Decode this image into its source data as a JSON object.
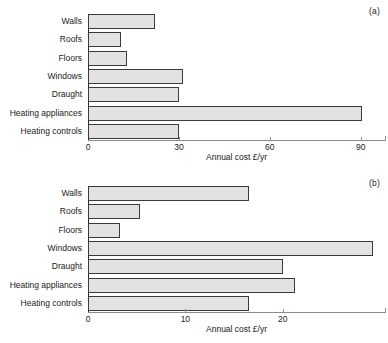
{
  "figure": {
    "background": "#ffffff",
    "bar_fill": "#e2e2e2",
    "bar_edge": "#3a3a3a",
    "axis_color": "#8c8c8c"
  },
  "panels": [
    {
      "tag": "(a)",
      "xlabel": "Annual cost £/yr",
      "ticks": [
        "0",
        "30",
        "60",
        "90"
      ],
      "categories": [
        "Walls",
        "Roofs",
        "Floors",
        "Windows",
        "Draught",
        "Heating appliances",
        "Heating controls"
      ],
      "values": [
        22,
        11,
        13,
        31.5,
        30,
        90.5,
        30
      ]
    },
    {
      "tag": "(b)",
      "xlabel": "Annual cost £/yr",
      "ticks": [
        "0",
        "10",
        "20"
      ],
      "categories": [
        "Walls",
        "Roofs",
        "Floors",
        "Windows",
        "Draught",
        "Heating appliances",
        "Heating controls"
      ],
      "values": [
        16.5,
        5.3,
        3.3,
        29.3,
        20,
        21.3,
        16.5
      ]
    }
  ],
  "chart_data": [
    {
      "type": "bar",
      "orientation": "horizontal",
      "panel": "(a)",
      "title": "",
      "xlabel": "Annual cost £/yr",
      "ylabel": "",
      "categories": [
        "Walls",
        "Roofs",
        "Floors",
        "Windows",
        "Draught",
        "Heating appliances",
        "Heating controls"
      ],
      "values": [
        22,
        11,
        13,
        31.5,
        30,
        90.5,
        30
      ],
      "xlim": [
        0,
        98
      ],
      "xticks": [
        0,
        30,
        60,
        90
      ],
      "grid": false,
      "legend": false
    },
    {
      "type": "bar",
      "orientation": "horizontal",
      "panel": "(b)",
      "title": "",
      "xlabel": "Annual cost £/yr",
      "ylabel": "",
      "categories": [
        "Walls",
        "Roofs",
        "Floors",
        "Windows",
        "Draught",
        "Heating appliances",
        "Heating controls"
      ],
      "values": [
        16.5,
        5.3,
        3.3,
        29.3,
        20,
        21.3,
        16.5
      ],
      "xlim": [
        0,
        30.5
      ],
      "xticks": [
        0,
        10,
        20
      ],
      "grid": false,
      "legend": false
    }
  ]
}
